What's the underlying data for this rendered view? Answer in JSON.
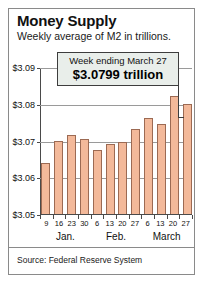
{
  "header": {
    "title": "Money Supply",
    "subtitle": "Weekly average of M2 in trillions."
  },
  "callout": {
    "line1": "Week ending March 27",
    "line2": "$3.0799 trillion"
  },
  "footer": {
    "source": "Source: Federal Reserve System"
  },
  "colors": {
    "bar_fill": "#f3b99a",
    "bar_stroke": "#9c6a53",
    "callout_fill": "#e9eeea",
    "callout_border": "#3d3d3d",
    "grid": "#9a9a9a",
    "frame": "#8a8a8a"
  },
  "chart_data": {
    "type": "bar",
    "title": "Money Supply",
    "subtitle": "Weekly average of M2 in trillions.",
    "xlabel": "",
    "ylabel": "",
    "ylim": [
      3.05,
      3.09
    ],
    "yticks": [
      3.05,
      3.06,
      3.07,
      3.08,
      3.09
    ],
    "ytick_labels": [
      "$3.05",
      "$3.06",
      "$3.07",
      "$3.08",
      "$3.09"
    ],
    "grid": true,
    "legend": false,
    "categories": [
      "9",
      "16",
      "23",
      "30",
      "6",
      "13",
      "20",
      "27",
      "6",
      "13",
      "20",
      "27"
    ],
    "months": [
      {
        "label": "Jan.",
        "start_index": 0,
        "end_index": 3
      },
      {
        "label": "Feb.",
        "start_index": 4,
        "end_index": 7
      },
      {
        "label": "March",
        "start_index": 8,
        "end_index": 11
      }
    ],
    "values": [
      3.0638,
      3.07,
      3.0715,
      3.0705,
      3.0675,
      3.069,
      3.0695,
      3.073,
      3.076,
      3.0745,
      3.0822,
      3.0799
    ],
    "annotations": [
      {
        "text": "Week ending March 27",
        "value": 3.0799,
        "category_index": 11
      },
      {
        "text": "$3.0799 trillion",
        "value": 3.0799,
        "category_index": 11
      }
    ]
  }
}
